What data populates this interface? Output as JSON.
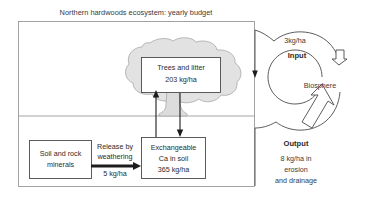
{
  "title": "Northern hardwoods ecosystem: yearly budget",
  "boxes": {
    "trees": {
      "line1": "Trees and litter",
      "line2": "203 kg/ha"
    },
    "minerals": {
      "line1": "Soil and rock",
      "line2": "minerals"
    },
    "exchangeable": {
      "line1": "Exchangeable",
      "line2": "Ca in soil",
      "line3": "365 kg/ha"
    }
  },
  "flows": {
    "weathering": {
      "line1": "Release by",
      "line2": "weathering",
      "line3": "5 kg/ha"
    }
  },
  "cycle": {
    "input_value": "3kg/ha",
    "input_label": "Input",
    "center_label": "Biosphere",
    "output_label": "Output",
    "output_line1": "8 kg/ha in",
    "output_line2": "erosion",
    "output_line3": "and drainage"
  },
  "colors": {
    "canopy_fill": "#e2e2e2",
    "canopy_stroke": "#a8a8a8",
    "box_stroke": "#4a4a4a",
    "frame_stroke": "#8d8d8d",
    "arrow": "#1c1c1c",
    "text": "#2b2b2b",
    "background": "#ffffff"
  }
}
